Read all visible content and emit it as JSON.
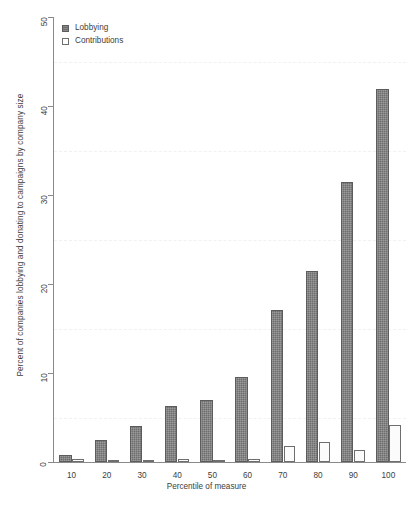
{
  "chart_data": {
    "type": "bar",
    "title": "",
    "xlabel": "Percentile of measure",
    "ylabel": "Percent of companies lobbying and donating to campaigns by company size",
    "categories": [
      "10",
      "20",
      "30",
      "40",
      "50",
      "60",
      "70",
      "80",
      "90",
      "100"
    ],
    "series": [
      {
        "name": "Lobbying",
        "color": "#6e6e6e",
        "values": [
          0.8,
          2.5,
          4.0,
          6.3,
          7.0,
          9.6,
          17.1,
          21.5,
          31.5,
          41.9
        ]
      },
      {
        "name": "Contributions",
        "color": "#ffffff",
        "values": [
          0.3,
          0.05,
          0.05,
          0.3,
          0.15,
          0.35,
          1.8,
          2.2,
          1.4,
          4.2
        ]
      }
    ],
    "ylim": [
      0,
      50
    ],
    "yticks": [
      0,
      10,
      20,
      30,
      40,
      50
    ],
    "ytick_labels": [
      "0",
      "10",
      "20",
      "30",
      "40",
      "50"
    ],
    "gridlines": [
      5,
      15,
      25,
      35,
      45
    ],
    "grid": true,
    "legend_position": "top-left"
  },
  "legend": {
    "entries": [
      {
        "label": "Lobbying",
        "swatch": "filled-square-icon"
      },
      {
        "label": "Contributions",
        "swatch": "open-square-icon"
      }
    ]
  },
  "caption": {
    "text": ""
  }
}
